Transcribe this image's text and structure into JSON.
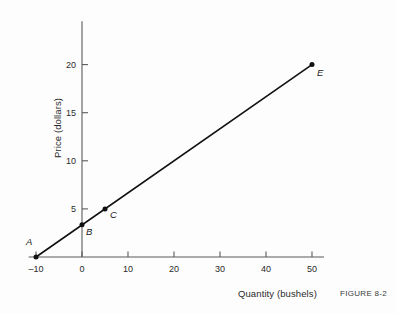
{
  "figure": {
    "caption": "FIGURE 8-2"
  },
  "chart_data": {
    "type": "line",
    "title": "",
    "subtitle": "",
    "xlabel": "Quantity (bushels)",
    "ylabel": "Price (dollars)",
    "xlim": [
      -12,
      52
    ],
    "ylim": [
      0,
      24.5
    ],
    "xticks": [
      -10,
      0,
      10,
      20,
      30,
      40,
      50
    ],
    "xtick_labels": [
      "–10",
      "0",
      "10",
      "20",
      "30",
      "40",
      "50"
    ],
    "yticks": [
      5,
      10,
      15,
      20
    ],
    "ytick_labels": [
      "5",
      "10",
      "15",
      "20"
    ],
    "grid": false,
    "legend": null,
    "series": [
      {
        "name": "supply line",
        "x": [
          -10,
          50
        ],
        "y": [
          0,
          20
        ],
        "color": "#111111",
        "linewidth": 1.6
      }
    ],
    "points": [
      {
        "label": "A",
        "x": -10,
        "y": 0,
        "label_dx": -10,
        "label_dy": -11
      },
      {
        "label": "B",
        "x": 0,
        "y": 3.35,
        "label_dx": 4,
        "label_dy": 11
      },
      {
        "label": "C",
        "x": 5,
        "y": 5.0,
        "label_dx": 5,
        "label_dy": 10
      },
      {
        "label": "E",
        "x": 50,
        "y": 20,
        "label_dx": 5,
        "label_dy": 12
      }
    ],
    "annotations": [],
    "axis_color": "#5a5a5a",
    "point_color": "#111111"
  }
}
